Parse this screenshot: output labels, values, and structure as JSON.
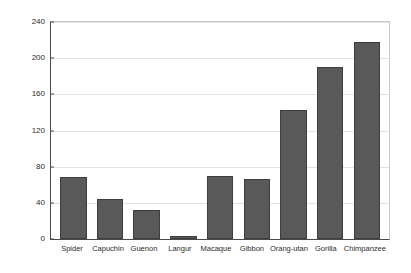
{
  "chart_data": {
    "type": "bar",
    "title": "",
    "subtitle": "",
    "xlabel": "",
    "ylabel": "",
    "categories": [
      "Spider",
      "Capuchin",
      "Guenon",
      "Langur",
      "Macaque",
      "Gibbon",
      "Orang-utan",
      "Gorilla",
      "Chimpanzee"
    ],
    "values": [
      69,
      44,
      32,
      3,
      70,
      66,
      143,
      190,
      218
    ],
    "ylim": [
      0,
      240
    ],
    "yticks": [
      0,
      40,
      80,
      120,
      160,
      200,
      240
    ],
    "ytick_labels": [
      "0",
      "40",
      "80",
      "120",
      "160",
      "200",
      "240"
    ],
    "grid": true,
    "grid_axis": "y",
    "legend": false,
    "legend_position": "none",
    "bar_color": "#595959",
    "bar_edge_color": "#3d3d3d",
    "axis_color": "#4a4a4a",
    "grid_color": "#e2e2e2",
    "background_color": "#ffffff",
    "text_color": "#2b2b2b"
  }
}
